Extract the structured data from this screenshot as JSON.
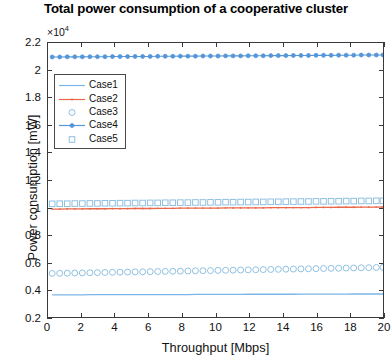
{
  "chart_data": {
    "type": "line",
    "title": "Total power consumption of a cooperative cluster",
    "xlabel": "Throughput [Mbps]",
    "ylabel": "Power consumption [mW]",
    "y_exponent_label": "×10",
    "y_exponent_power": "4",
    "y_scale_factor": 10000,
    "xlim": [
      0,
      20
    ],
    "ylim": [
      0.2,
      2.2
    ],
    "xticks": [
      0,
      2,
      4,
      6,
      8,
      10,
      12,
      14,
      16,
      18,
      20
    ],
    "yticks": [
      0.2,
      0.4,
      0.6,
      0.8,
      1,
      1.2,
      1.4,
      1.6,
      1.8,
      2,
      2.2
    ],
    "xtick_labels": [
      "0",
      "2",
      "4",
      "6",
      "8",
      "10",
      "12",
      "14",
      "16",
      "18",
      "20"
    ],
    "ytick_labels": [
      "0.2",
      "0.4",
      "0.6",
      "0.8",
      "1",
      "1.2",
      "1.4",
      "1.6",
      "1.8",
      "2",
      "2.2"
    ],
    "grid": false,
    "legend_position": "upper left",
    "x": [
      0.25,
      0.7,
      1.15,
      1.6,
      2.05,
      2.5,
      2.95,
      3.4,
      3.85,
      4.3,
      4.75,
      5.2,
      5.65,
      6.1,
      6.55,
      7.0,
      7.45,
      7.9,
      8.35,
      8.8,
      9.25,
      9.7,
      10.15,
      10.6,
      11.05,
      11.5,
      11.95,
      12.4,
      12.85,
      13.3,
      13.75,
      14.2,
      14.65,
      15.1,
      15.55,
      16.0,
      16.45,
      16.9,
      17.35,
      17.8,
      18.25,
      18.7,
      19.15,
      19.6,
      20.0
    ],
    "series": [
      {
        "name": "Case1",
        "label": "Case1",
        "style": "line",
        "color": "#7cb5e8",
        "marker": "none",
        "values": [
          0.362,
          0.362,
          0.362,
          0.362,
          0.362,
          0.363,
          0.363,
          0.363,
          0.363,
          0.363,
          0.363,
          0.363,
          0.364,
          0.364,
          0.364,
          0.364,
          0.364,
          0.364,
          0.364,
          0.365,
          0.365,
          0.365,
          0.365,
          0.365,
          0.365,
          0.365,
          0.366,
          0.366,
          0.366,
          0.366,
          0.366,
          0.366,
          0.366,
          0.367,
          0.367,
          0.367,
          0.367,
          0.367,
          0.367,
          0.367,
          0.368,
          0.368,
          0.368,
          0.368,
          0.368
        ]
      },
      {
        "name": "Case2",
        "label": "Case2",
        "style": "line",
        "color": "#e8684a",
        "marker": "dot",
        "values": [
          0.988,
          0.988,
          0.989,
          0.989,
          0.989,
          0.99,
          0.99,
          0.99,
          0.991,
          0.991,
          0.991,
          0.992,
          0.992,
          0.992,
          0.993,
          0.993,
          0.993,
          0.994,
          0.994,
          0.994,
          0.995,
          0.995,
          0.995,
          0.996,
          0.996,
          0.996,
          0.997,
          0.997,
          0.997,
          0.998,
          0.998,
          0.998,
          0.999,
          0.999,
          0.999,
          1.0,
          1.0,
          1.0,
          1.001,
          1.001,
          1.001,
          1.002,
          1.002,
          1.002,
          1.003
        ]
      },
      {
        "name": "Case3",
        "label": "Case3",
        "style": "markers",
        "color": "#8fbfe0",
        "marker": "circle",
        "values": [
          0.518,
          0.519,
          0.52,
          0.521,
          0.522,
          0.523,
          0.524,
          0.525,
          0.526,
          0.527,
          0.528,
          0.529,
          0.53,
          0.531,
          0.532,
          0.533,
          0.534,
          0.535,
          0.536,
          0.537,
          0.538,
          0.539,
          0.54,
          0.541,
          0.542,
          0.543,
          0.544,
          0.545,
          0.546,
          0.547,
          0.548,
          0.549,
          0.55,
          0.551,
          0.552,
          0.553,
          0.554,
          0.555,
          0.556,
          0.557,
          0.558,
          0.559,
          0.56,
          0.561,
          0.562
        ]
      },
      {
        "name": "Case4",
        "label": "Case4",
        "style": "line-markers",
        "color": "#5596d8",
        "marker": "filled-circle",
        "values": [
          2.098,
          2.098,
          2.099,
          2.099,
          2.099,
          2.1,
          2.1,
          2.1,
          2.101,
          2.101,
          2.101,
          2.102,
          2.102,
          2.102,
          2.103,
          2.103,
          2.103,
          2.104,
          2.104,
          2.104,
          2.105,
          2.105,
          2.105,
          2.106,
          2.106,
          2.106,
          2.107,
          2.107,
          2.107,
          2.108,
          2.108,
          2.108,
          2.109,
          2.109,
          2.109,
          2.11,
          2.11,
          2.11,
          2.111,
          2.111,
          2.111,
          2.112,
          2.112,
          2.112,
          2.113
        ]
      },
      {
        "name": "Case5",
        "label": "Case5",
        "style": "markers",
        "color": "#8fbfe0",
        "marker": "square",
        "values": [
          1.026,
          1.027,
          1.027,
          1.028,
          1.028,
          1.029,
          1.029,
          1.03,
          1.03,
          1.031,
          1.031,
          1.032,
          1.032,
          1.033,
          1.033,
          1.034,
          1.034,
          1.035,
          1.035,
          1.036,
          1.036,
          1.037,
          1.037,
          1.038,
          1.038,
          1.039,
          1.039,
          1.04,
          1.04,
          1.041,
          1.041,
          1.042,
          1.042,
          1.043,
          1.043,
          1.044,
          1.044,
          1.045,
          1.045,
          1.046,
          1.046,
          1.047,
          1.047,
          1.048,
          1.048
        ]
      }
    ]
  },
  "legend": {
    "entries": [
      {
        "label": "Case1"
      },
      {
        "label": "Case2"
      },
      {
        "label": "Case3"
      },
      {
        "label": "Case4"
      },
      {
        "label": "Case5"
      }
    ]
  }
}
